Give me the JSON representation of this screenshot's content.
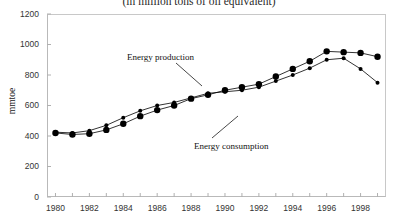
{
  "chart_data": {
    "type": "line",
    "title": "(in million tons of oil equivalent)",
    "xlabel": "",
    "ylabel": "mmtoe",
    "ylim": [
      0,
      1200
    ],
    "xlim": [
      1979.5,
      1999.5
    ],
    "yticks": [
      0,
      200,
      400,
      600,
      800,
      1000,
      1200
    ],
    "ytick_labels": [
      "0",
      "200",
      "400",
      "600",
      "800",
      "1000",
      "1200"
    ],
    "xticks": [
      1980,
      1982,
      1984,
      1986,
      1988,
      1990,
      1992,
      1994,
      1996,
      1998
    ],
    "xtick_labels": [
      "1980",
      "1982",
      "1984",
      "1986",
      "1988",
      "1990",
      "1992",
      "1994",
      "1996",
      "1998"
    ],
    "grid": false,
    "legend_position": "annotations",
    "x": [
      1980,
      1981,
      1982,
      1983,
      1984,
      1985,
      1986,
      1987,
      1988,
      1989,
      1990,
      1991,
      1992,
      1993,
      1994,
      1995,
      1996,
      1997,
      1998,
      1999
    ],
    "series": [
      {
        "name": "Energy production",
        "marker": "small-dot",
        "color": "#000000",
        "values": [
          425,
          420,
          435,
          470,
          520,
          565,
          600,
          620,
          650,
          680,
          690,
          700,
          720,
          760,
          800,
          845,
          900,
          910,
          840,
          750
        ]
      },
      {
        "name": "Energy consumption",
        "marker": "large-dot",
        "color": "#000000",
        "values": [
          420,
          410,
          415,
          440,
          480,
          530,
          570,
          600,
          645,
          670,
          700,
          720,
          740,
          790,
          840,
          890,
          955,
          950,
          945,
          920
        ]
      }
    ],
    "annotations": [
      {
        "label": "Energy production",
        "target_series": "Energy production"
      },
      {
        "label": "Energy consumption",
        "target_series": "Energy consumption"
      }
    ]
  }
}
